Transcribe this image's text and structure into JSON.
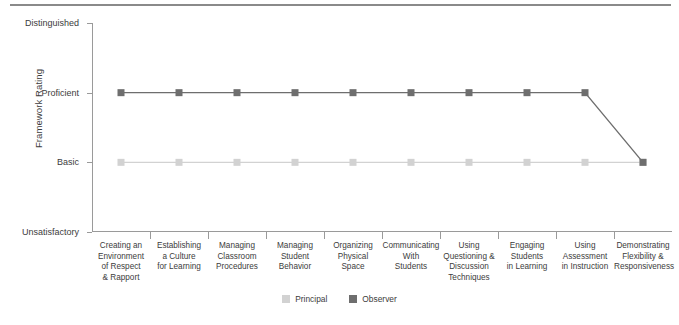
{
  "chart_data": {
    "type": "line",
    "title": "",
    "xlabel": "",
    "ylabel": "Framework Rating",
    "grid": false,
    "legend_position": "bottom-center",
    "y_categories": [
      "Unsatisfactory",
      "Basic",
      "Proficient",
      "Distinguished"
    ],
    "ylim": [
      0,
      3
    ],
    "y_tick_labels": [
      "Distinguished",
      "Proficient",
      "Basic",
      "Unsatisfactory"
    ],
    "y_tick_values": [
      3,
      2,
      1,
      0
    ],
    "categories": [
      "Creating an Environment of Respect & Rapport",
      "Establishing a Culture for Learning",
      "Managing Classroom Procedures",
      "Managing Student Behavior",
      "Organizing Physical Space",
      "Communicating With Students",
      "Using Questioning & Discussion Techniques",
      "Engaging Students in Learning",
      "Using Assessment in Instruction",
      "Demonstrating Flexibility & Responsiveness"
    ],
    "category_lines": [
      [
        "Creating an",
        "Environment",
        "of Respect",
        "& Rapport"
      ],
      [
        "Establishing",
        "a Culture",
        "for Learning"
      ],
      [
        "Managing",
        "Classroom",
        "Procedures"
      ],
      [
        "Managing",
        "Student",
        "Behavior"
      ],
      [
        "Organizing",
        "Physical",
        "Space"
      ],
      [
        "Communicating",
        "With",
        "Students"
      ],
      [
        "Using",
        "Questioning &",
        "Discussion",
        "Techniques"
      ],
      [
        "Engaging",
        "Students",
        "in Learning"
      ],
      [
        "Using",
        "Assessment",
        "in Instruction"
      ],
      [
        "Demonstrating",
        "Flexibility &",
        "Responsiveness"
      ]
    ],
    "series": [
      {
        "name": "Principal",
        "color": "#d2d2d2",
        "values": [
          1,
          1,
          1,
          1,
          1,
          1,
          1,
          1,
          1,
          1
        ],
        "value_labels": [
          "Basic",
          "Basic",
          "Basic",
          "Basic",
          "Basic",
          "Basic",
          "Basic",
          "Basic",
          "Basic",
          "Basic"
        ]
      },
      {
        "name": "Observer",
        "color": "#6e6e6e",
        "values": [
          2,
          2,
          2,
          2,
          2,
          2,
          2,
          2,
          2,
          1
        ],
        "value_labels": [
          "Proficient",
          "Proficient",
          "Proficient",
          "Proficient",
          "Proficient",
          "Proficient",
          "Proficient",
          "Proficient",
          "Proficient",
          "Basic"
        ]
      }
    ]
  },
  "legend": {
    "items": [
      {
        "label": "Principal",
        "color": "#d2d2d2"
      },
      {
        "label": "Observer",
        "color": "#6e6e6e"
      }
    ]
  },
  "colors": {
    "principal": "#d2d2d2",
    "observer": "#6e6e6e",
    "axis": "#9a9a9a",
    "rule": "#8a8a8a",
    "text": "#3c3c3c"
  }
}
